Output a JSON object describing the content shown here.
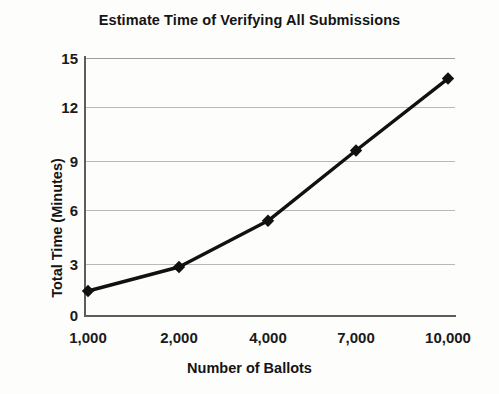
{
  "chart_data": {
    "type": "line",
    "title": "Estimate Time of Verifying All Submissions",
    "xlabel": "Number of Ballots",
    "ylabel": "Total Time (Minutes)",
    "categories": [
      "1,000",
      "2,000",
      "4,000",
      "7,000",
      "10,000"
    ],
    "x_values": [
      1000,
      2000,
      4000,
      7000,
      10000
    ],
    "values": [
      1.4,
      2.8,
      5.5,
      9.6,
      13.8
    ],
    "series": [
      {
        "name": "Total Time (Minutes)",
        "values": [
          1.4,
          2.8,
          5.5,
          9.6,
          13.8
        ],
        "marker": "diamond",
        "color": "#111111"
      }
    ],
    "ylim": [
      0,
      15
    ],
    "yticks": [
      0,
      3,
      6,
      9,
      12,
      15
    ],
    "ytick_labels": [
      "0",
      "3",
      "6",
      "9",
      "12",
      "15"
    ],
    "grid": "horizontal",
    "legend": "none",
    "axis_scale": "categorical"
  },
  "style": {
    "line_color": "#111111",
    "marker_color": "#111111",
    "grid_color": "#b9b9b9",
    "axis_color": "#5d5d5d",
    "background": "#fdfdfc",
    "text_color": "#141414"
  }
}
